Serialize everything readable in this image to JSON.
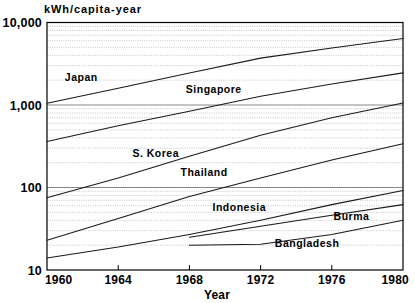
{
  "chart_data": {
    "type": "line",
    "title": "",
    "subtitle": "",
    "unit_label": "kWh/capita-year",
    "xlabel": "Year",
    "ylabel": "",
    "yscale": "log",
    "ylim": [
      10,
      10000
    ],
    "xlim": [
      1960,
      1980
    ],
    "grid": "log-minor-gridlines-horizontal",
    "legend": "inline-labels",
    "ytick_labels": [
      "10,000",
      "1,000",
      "100",
      "10"
    ],
    "ytick_values": [
      10000,
      1000,
      100,
      10
    ],
    "xtick_labels": [
      "1960",
      "1964",
      "1968",
      "1972",
      "1976",
      "1980"
    ],
    "xtick_values": [
      1960,
      1964,
      1968,
      1972,
      1976,
      1980
    ],
    "series": [
      {
        "name": "Japan",
        "label": "Japan",
        "label_x": 1961.0,
        "label_y": 2150,
        "x": [
          1960,
          1964,
          1968,
          1972,
          1976,
          1980
        ],
        "values": [
          1050,
          1600,
          2450,
          3700,
          4900,
          6400
        ]
      },
      {
        "name": "Singapore",
        "label": "Singapore",
        "label_x": 1967.8,
        "label_y": 1550,
        "x": [
          1960,
          1964,
          1968,
          1972,
          1976,
          1980
        ],
        "values": [
          360,
          560,
          840,
          1280,
          1800,
          2450
        ]
      },
      {
        "name": "S. Korea",
        "label": "S. Korea",
        "label_x": 1964.8,
        "label_y": 255,
        "x": [
          1960,
          1964,
          1968,
          1972,
          1976,
          1980
        ],
        "values": [
          75,
          130,
          240,
          430,
          700,
          1060
        ]
      },
      {
        "name": "Thailand",
        "label": "Thailand",
        "label_x": 1967.5,
        "label_y": 150,
        "x": [
          1960,
          1964,
          1968,
          1972,
          1976,
          1980
        ],
        "values": [
          23,
          42,
          78,
          130,
          215,
          340
        ]
      },
      {
        "name": "Indonesia",
        "label": "Indonesia",
        "label_x": 1969.3,
        "label_y": 58,
        "x": [
          1960,
          1964,
          1968,
          1972,
          1976,
          1980
        ],
        "values": [
          14,
          19,
          27,
          40,
          62,
          92
        ]
      },
      {
        "name": "Burma",
        "label": "Burma",
        "label_x": 1976.1,
        "label_y": 44,
        "x": [
          1968,
          1972,
          1976,
          1980
        ],
        "values": [
          25,
          34,
          46,
          62
        ]
      },
      {
        "name": "Bangladesh",
        "label": "Bangladesh",
        "label_x": 1972.8,
        "label_y": 21,
        "x": [
          1968,
          1972,
          1976,
          1980
        ],
        "values": [
          20,
          20.5,
          27,
          40
        ]
      }
    ]
  }
}
